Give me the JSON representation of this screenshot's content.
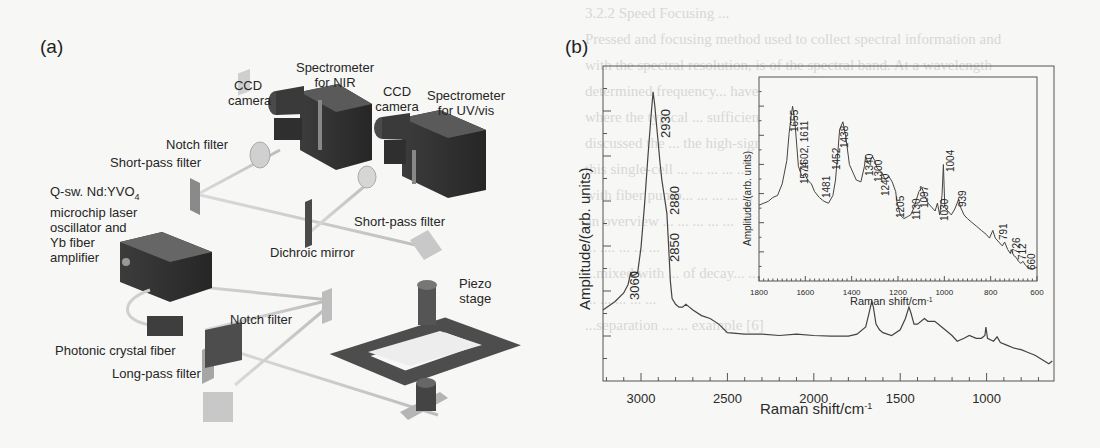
{
  "panels": {
    "a": {
      "label": "(a)",
      "components": {
        "ccd_nir_1": "CCD",
        "ccd_nir_2": "camera",
        "spec_nir_1": "Spectrometer",
        "spec_nir_2": "for NIR",
        "ccd_uv_1": "CCD",
        "ccd_uv_2": "camera",
        "spec_uv_1": "Spectrometer",
        "spec_uv_2": "for UV/vis",
        "notch_top": "Notch filter",
        "shortpass_left": "Short-pass filter",
        "laser_1": "Q-sw. Nd:YVO",
        "laser_1_sub": "4",
        "laser_2": "microchip laser",
        "laser_3": "oscillator and",
        "laser_4": "Yb fiber",
        "laser_5": "amplifier",
        "shortpass_right": "Short-pass filter",
        "dichroic": "Dichroic mirror",
        "piezo_1": "Piezo",
        "piezo_2": "stage",
        "notch_bottom": "Notch filter",
        "pcf": "Photonic crystal fiber",
        "longpass": "Long-pass filter"
      }
    },
    "b": {
      "label": "(b)"
    }
  },
  "background_bleed": [
    "3.2.2  Speed  Focusing ...",
    "Pressed and focusing method used to collect spectral information and",
    "with the spectral resolution, is of the spectral band.  At a wavelength",
    "determined frequency... have been developed Raman  can be obtained",
    "where the typical ... sufficiently resolved from the  spectra...",
    "discussed the ... the high-signal ... the  ... ... applicable",
    "this single-cell ... ... ... ... ...",
    "with fiber pump... ... ... ... ...",
    "an overview ... ... ... ... ...",
    "  ... .... ... ... ...",
    "...mixed with ... of decay... ... ...",
    "    ... ... ... ... ...",
    "...separation ... ... example [6]"
  ],
  "chart_data": [
    {
      "type": "line",
      "title": "",
      "xlabel": "Raman shift/cm-1",
      "ylabel": "Amplitude/(arb. units)",
      "xlim": [
        3220,
        610
      ],
      "x_reversed": true,
      "xticks": [
        3000,
        2500,
        2000,
        1500,
        1000
      ],
      "ylim": [
        0,
        1
      ],
      "grid": false,
      "annotations": [
        "3060",
        "2930",
        "2880",
        "2850"
      ],
      "x": [
        3220,
        3150,
        3100,
        3075,
        3060,
        3050,
        3020,
        3000,
        2980,
        2960,
        2940,
        2930,
        2920,
        2905,
        2890,
        2880,
        2870,
        2860,
        2850,
        2840,
        2830,
        2820,
        2800,
        2780,
        2760,
        2740,
        2720,
        2700,
        2650,
        2600,
        2550,
        2500,
        2400,
        2300,
        2200,
        2100,
        2000,
        1900,
        1800,
        1750,
        1700,
        1680,
        1665,
        1655,
        1640,
        1620,
        1600,
        1550,
        1500,
        1470,
        1450,
        1438,
        1420,
        1400,
        1360,
        1340,
        1300,
        1260,
        1240,
        1200,
        1170,
        1130,
        1100,
        1060,
        1030,
        1010,
        1004,
        995,
        960,
        939,
        920,
        880,
        840,
        800,
        760,
        720,
        680,
        640,
        620
      ],
      "values": [
        0.18,
        0.21,
        0.24,
        0.27,
        0.31,
        0.3,
        0.31,
        0.4,
        0.55,
        0.72,
        0.88,
        0.95,
        0.9,
        0.8,
        0.7,
        0.64,
        0.6,
        0.56,
        0.52,
        0.4,
        0.28,
        0.22,
        0.2,
        0.19,
        0.19,
        0.2,
        0.19,
        0.18,
        0.16,
        0.15,
        0.13,
        0.1,
        0.095,
        0.095,
        0.09,
        0.095,
        0.09,
        0.088,
        0.088,
        0.095,
        0.12,
        0.17,
        0.21,
        0.19,
        0.13,
        0.11,
        0.1,
        0.09,
        0.11,
        0.15,
        0.19,
        0.17,
        0.13,
        0.13,
        0.15,
        0.14,
        0.14,
        0.12,
        0.11,
        0.09,
        0.07,
        0.08,
        0.09,
        0.08,
        0.08,
        0.09,
        0.12,
        0.08,
        0.07,
        0.085,
        0.065,
        0.055,
        0.045,
        0.04,
        0.03,
        0.02,
        0.005,
        -0.01,
        0.0
      ]
    },
    {
      "type": "line",
      "title": "inset",
      "xlabel": "Raman shift/cm-1",
      "ylabel": "Amplitude/(arb. units)",
      "xlim": [
        1800,
        600
      ],
      "x_reversed": true,
      "xticks": [
        1800,
        1600,
        1400,
        1200,
        1000,
        800,
        600
      ],
      "ylim": [
        0,
        1
      ],
      "grid": false,
      "annotations": [
        "1655",
        "1602, 1611",
        "1574",
        "1481",
        "1452",
        "1438",
        "1340",
        "1300",
        "1240",
        "1205",
        "1130",
        "1097",
        "1030",
        "1004",
        "939",
        "791",
        "726",
        "712",
        "660"
      ],
      "x": [
        1800,
        1760,
        1740,
        1720,
        1700,
        1680,
        1670,
        1660,
        1655,
        1645,
        1630,
        1615,
        1602,
        1590,
        1574,
        1560,
        1540,
        1520,
        1500,
        1481,
        1470,
        1460,
        1452,
        1438,
        1425,
        1410,
        1395,
        1380,
        1360,
        1345,
        1340,
        1330,
        1320,
        1310,
        1300,
        1290,
        1270,
        1255,
        1240,
        1225,
        1210,
        1205,
        1190,
        1175,
        1160,
        1145,
        1130,
        1120,
        1110,
        1097,
        1085,
        1070,
        1055,
        1040,
        1030,
        1020,
        1010,
        1004,
        998,
        985,
        970,
        955,
        945,
        939,
        930,
        915,
        900,
        880,
        860,
        840,
        820,
        805,
        791,
        780,
        765,
        750,
        740,
        726,
        715,
        712,
        700,
        690,
        680,
        670,
        660,
        650,
        640,
        620,
        600
      ],
      "values": [
        0.35,
        0.37,
        0.39,
        0.4,
        0.46,
        0.58,
        0.72,
        0.82,
        0.86,
        0.78,
        0.55,
        0.5,
        0.51,
        0.48,
        0.46,
        0.42,
        0.39,
        0.37,
        0.36,
        0.4,
        0.48,
        0.62,
        0.74,
        0.78,
        0.7,
        0.56,
        0.52,
        0.48,
        0.47,
        0.55,
        0.6,
        0.57,
        0.58,
        0.6,
        0.58,
        0.54,
        0.52,
        0.48,
        0.5,
        0.47,
        0.42,
        0.37,
        0.3,
        0.28,
        0.29,
        0.3,
        0.34,
        0.38,
        0.42,
        0.44,
        0.4,
        0.36,
        0.34,
        0.32,
        0.36,
        0.3,
        0.4,
        0.56,
        0.34,
        0.32,
        0.3,
        0.33,
        0.36,
        0.38,
        0.34,
        0.3,
        0.28,
        0.26,
        0.24,
        0.22,
        0.2,
        0.18,
        0.22,
        0.18,
        0.16,
        0.14,
        0.16,
        0.12,
        0.1,
        0.12,
        0.09,
        0.08,
        0.06,
        0.05,
        0.06,
        0.04,
        0.03,
        0.02,
        0.03
      ]
    }
  ],
  "charts_text": {
    "main": {
      "ylabel": "Amplitude/(arb. units)",
      "xlabel": "Raman shift/cm",
      "xlabel_sup": "-1",
      "ticks": [
        "3000",
        "2500",
        "2000",
        "1500",
        "1000"
      ],
      "peaks": [
        "3060",
        "2930",
        "2880",
        "2850"
      ]
    },
    "inset": {
      "ylabel": "Amplitude/(arb. units)",
      "xlabel": "Raman shift/cm",
      "xlabel_sup": "-1",
      "ticks": [
        "1800",
        "1600",
        "1400",
        "1200",
        "1000",
        "800",
        "600"
      ],
      "peaks": [
        "1655",
        "1602, 1611",
        "1574",
        "1481",
        "1452",
        "1438",
        "1340",
        "1300",
        "1240",
        "1205",
        "1130",
        "1097",
        "1030",
        "1004",
        "939",
        "791",
        "726",
        "712",
        "660"
      ]
    }
  }
}
